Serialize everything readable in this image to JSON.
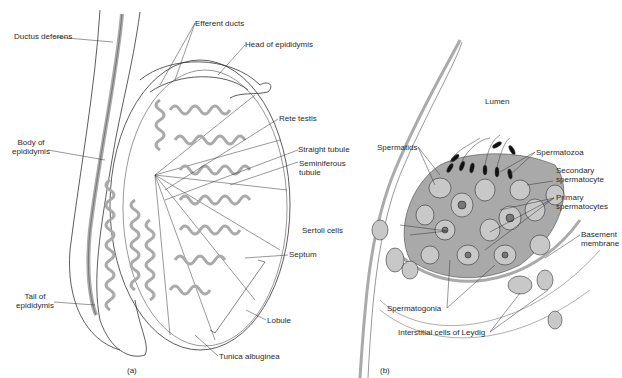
{
  "figure": {
    "panel_a": {
      "caption": "(a)",
      "labels": {
        "ductus_deferens": "Ductus deferens",
        "efferent_ducts": "Efferent ducts",
        "head_of_epididymis": "Head of epididymis",
        "rete_testis": "Rete testis",
        "body_of_epididymis_1": "Body of",
        "body_of_epididymis_2": "epididymis",
        "straight_tubule": "Straight tubule",
        "seminiferous_tubule_1": "Seminiferous",
        "seminiferous_tubule_2": "tubule",
        "septum": "Septum",
        "tail_of_epididymis_1": "Tail of",
        "tail_of_epididymis_2": "epididymis",
        "lobule": "Lobule",
        "tunica_albuginea": "Tunica albuginea"
      }
    },
    "panel_b": {
      "caption": "(b)",
      "labels": {
        "lumen": "Lumen",
        "spermatids": "Spermatids",
        "spermatozoa": "Spermatozoa",
        "secondary_spermatocyte_1": "Secondary",
        "secondary_spermatocyte_2": "spermatocyte",
        "primary_spermatocytes_1": "Primary",
        "primary_spermatocytes_2": "spermatocytes",
        "sertoli_cells": "Sertoli cells",
        "basement_membrane_1": "Basement",
        "basement_membrane_2": "membrane",
        "spermatogonia": "Spermatogonia",
        "interstitial_cells": "Interstitial cells of Leydig"
      }
    },
    "colors": {
      "line": "#333333",
      "tubule_fill": "#b8b8b8",
      "epithelium_fill": "#a9a9a9",
      "cell_fill": "#c8c8c8",
      "background": "#ffffff"
    }
  }
}
